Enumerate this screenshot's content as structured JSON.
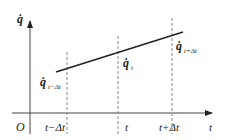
{
  "diagram": {
    "type": "velocity-vs-time linear interpolation",
    "axes": {
      "y_label": "q̇",
      "x_label": "t",
      "origin_label": "O"
    },
    "ticks": [
      {
        "label": "t−Δt"
      },
      {
        "label": "t"
      },
      {
        "label": "t+Δt"
      }
    ],
    "points": [
      {
        "label_base": "q̇",
        "label_sub": "t−Δt"
      },
      {
        "label_base": "q̇",
        "label_sub": "t"
      },
      {
        "label_base": "q̇",
        "label_sub": "t+Δt"
      }
    ],
    "colors": {
      "line": "#222222",
      "axis": "#333333",
      "dashed": "#777777"
    }
  }
}
